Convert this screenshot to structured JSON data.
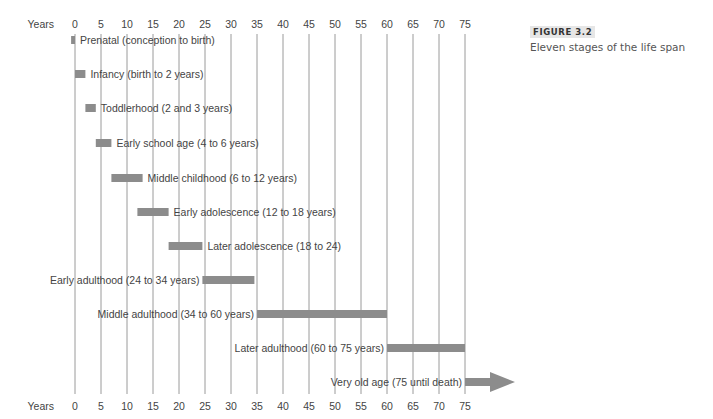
{
  "figure": {
    "label": "FIGURE 3.2",
    "caption": "Eleven stages of the life span"
  },
  "chart_data": {
    "type": "bar",
    "subtype": "gantt-timeline",
    "title": "Eleven stages of the life span",
    "xlabel": "Years",
    "ylabel": "",
    "xlim": [
      0,
      75
    ],
    "xticks": [
      0,
      5,
      10,
      15,
      20,
      25,
      30,
      35,
      40,
      45,
      50,
      55,
      60,
      65,
      70,
      75
    ],
    "grid": true,
    "axis_label_positions": [
      "top",
      "bottom"
    ],
    "stages": [
      {
        "label": "Prenatal (conception to birth)",
        "start": -0.75,
        "end": 0,
        "label_side": "right"
      },
      {
        "label": "Infancy (birth to 2 years)",
        "start": 0,
        "end": 2,
        "label_side": "right"
      },
      {
        "label": "Toddlerhood (2 and 3 years)",
        "start": 2,
        "end": 4,
        "label_side": "right"
      },
      {
        "label": "Early school age (4 to 6 years)",
        "start": 4,
        "end": 7,
        "label_side": "right"
      },
      {
        "label": "Middle childhood (6 to 12 years)",
        "start": 7,
        "end": 13,
        "label_side": "right"
      },
      {
        "label": "Early adolescence (12 to 18 years)",
        "start": 12,
        "end": 18,
        "label_side": "right"
      },
      {
        "label": "Later adolescence (18 to 24)",
        "start": 18,
        "end": 24.5,
        "label_side": "right"
      },
      {
        "label": "Early adulthood (24 to 34 years)",
        "start": 24.5,
        "end": 34.5,
        "label_side": "left"
      },
      {
        "label": "Middle adulthood (34 to 60 years)",
        "start": 35,
        "end": 60,
        "label_side": "left"
      },
      {
        "label": "Later adulthood (60 to 75 years)",
        "start": 60,
        "end": 75,
        "label_side": "left"
      },
      {
        "label": "Very old age (75 until death)",
        "start": 75,
        "end": null,
        "label_side": "left",
        "arrow": true
      }
    ],
    "colors": {
      "bar": "#8c8c8c",
      "grid": "#9a9a9a",
      "text": "#444444"
    }
  }
}
